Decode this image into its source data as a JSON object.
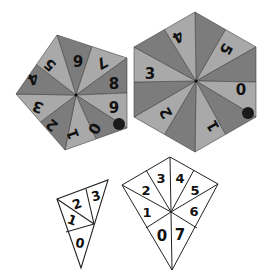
{
  "figure": {
    "colors": {
      "dark_sector": "#7c7c7c",
      "light_sector": "#a9a9a9",
      "stroke": "#444444",
      "outline_stroke": "#222222",
      "dot": "#1a1a1a",
      "background": "#ffffff"
    },
    "pentagon": {
      "sector_labels_clockwise_from_top": [
        "6",
        "7",
        "8",
        "9",
        "0",
        "1",
        "2",
        "3",
        "4",
        "5"
      ],
      "has_marker_dot": true
    },
    "hexagon": {
      "sector_labels_clockwise_from_top": [
        "5",
        "",
        "0",
        "",
        "1",
        "",
        "2",
        "3",
        "",
        "4"
      ],
      "has_marker_dot": true
    },
    "small_triangle": {
      "labels": [
        "2",
        "3",
        "1",
        "0"
      ]
    },
    "kite": {
      "labels": [
        "2",
        "3",
        "4",
        "5",
        "1",
        "6",
        "0",
        "7"
      ]
    }
  }
}
